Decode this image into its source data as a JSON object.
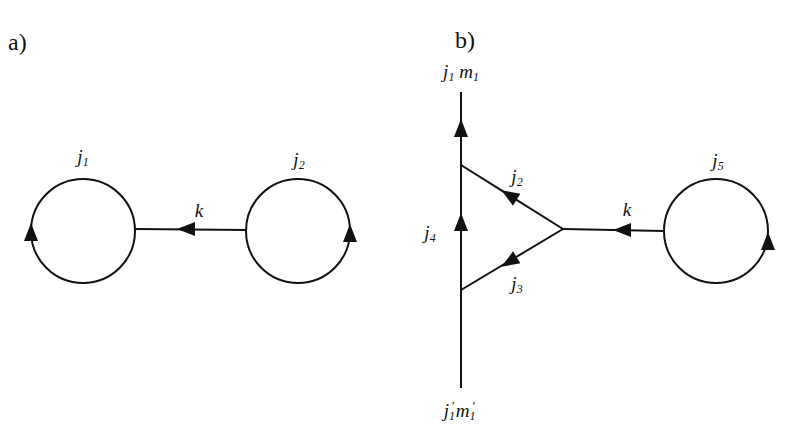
{
  "diagram": {
    "panels": [
      {
        "id": "a",
        "label": "a)",
        "nodes": [
          {
            "id": "loop-j1",
            "type": "closed-loop",
            "label": "j",
            "sub": "1",
            "arrow": "up, left side"
          },
          {
            "id": "loop-j2",
            "type": "closed-loop",
            "label": "j",
            "sub": "2",
            "arrow": "up, right side"
          }
        ],
        "edges": [
          {
            "id": "k",
            "label": "k",
            "from": "loop-j2",
            "to": "loop-j1",
            "arrow": "left"
          }
        ]
      },
      {
        "id": "b",
        "label": "b)",
        "external_lines": {
          "top": {
            "label_j": "j",
            "label_j_sub": "1",
            "label_m": "m",
            "label_m_sub": "1"
          },
          "bottom": {
            "label_j": "j",
            "label_j_sub": "1",
            "label_j_prime": "′",
            "label_m": "m",
            "label_m_sub": "1",
            "label_m_prime": "′"
          }
        },
        "edges": [
          {
            "id": "j4",
            "label": "j",
            "sub": "4",
            "direction": "up",
            "description": "vertical line between bottom and top triangle vertices"
          },
          {
            "id": "j2",
            "label": "j",
            "sub": "2",
            "direction": "toward upper-left vertex"
          },
          {
            "id": "j3",
            "label": "j",
            "sub": "3",
            "direction": "toward lower-left vertex"
          },
          {
            "id": "k",
            "label": "k",
            "direction": "left, from loop j5 to triangle vertex"
          }
        ],
        "nodes": [
          {
            "id": "loop-j5",
            "type": "closed-loop",
            "label": "j",
            "sub": "5",
            "arrow": "up, right side"
          }
        ]
      }
    ]
  },
  "labels": {
    "a_panel": "a)",
    "b_panel": "b)",
    "a_j1": {
      "base": "j",
      "sub": "1"
    },
    "a_j2": {
      "base": "j",
      "sub": "2"
    },
    "a_k": "k",
    "b_top": {
      "j": "j",
      "j_sub": "1",
      "m": "m",
      "m_sub": "1"
    },
    "b_bottom": {
      "j": "j",
      "j_sub": "1",
      "prime": "′",
      "m": "m",
      "m_sub": "1"
    },
    "b_j2": {
      "base": "j",
      "sub": "2"
    },
    "b_j3": {
      "base": "j",
      "sub": "3"
    },
    "b_j4": {
      "base": "j",
      "sub": "4"
    },
    "b_j5": {
      "base": "j",
      "sub": "5"
    },
    "b_k": "k"
  },
  "colors": {
    "stroke": "#111111",
    "background": "#ffffff"
  }
}
